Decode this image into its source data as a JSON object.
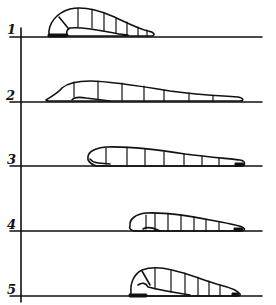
{
  "figure": {
    "stages": [
      {
        "label": "1"
      },
      {
        "label": "2"
      },
      {
        "label": "3"
      },
      {
        "label": "4"
      },
      {
        "label": "5"
      }
    ],
    "colors": {
      "ink": "#111111",
      "background": "#ffffff"
    }
  }
}
